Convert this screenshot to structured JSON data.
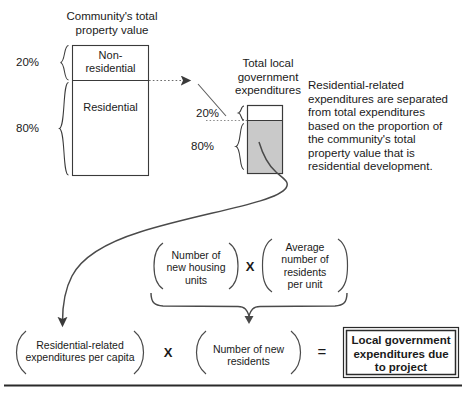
{
  "diagram": {
    "title_property_value": "Community's total\nproperty value",
    "title_expenditures": "Total local\ngovernment\nexpenditures",
    "note_text": "Residential-related\nexpenditures are separated\nfrom total expenditures\nbased on the proportion of\nthe community's total\nproperty value that is\nresidential development.",
    "property_box": {
      "segment_top_label": "Non-\nresidential",
      "segment_bottom_label": "Residential",
      "pct_top": "20%",
      "pct_bottom": "80%"
    },
    "expenditure_box": {
      "pct_top": "20%",
      "pct_bottom": "80%"
    },
    "formula": {
      "term_housing_units": "Number of\nnew housing\nunits",
      "term_residents_per_unit": "Average\nnumber of\nresidents\nper unit",
      "term_per_capita": "Residential-related\nexpenditures per capita",
      "term_new_residents": "Number of new\nresidents",
      "result": "Local government\nexpenditures due\nto project",
      "operator_multiply_top": "X",
      "operator_multiply_bottom": "X",
      "operator_equals": "="
    },
    "colors": {
      "stroke": "#3a3a3a",
      "shaded_fill": "#c9c9c9",
      "text": "#1a1a1a",
      "rule": "#2a2a2a"
    }
  }
}
